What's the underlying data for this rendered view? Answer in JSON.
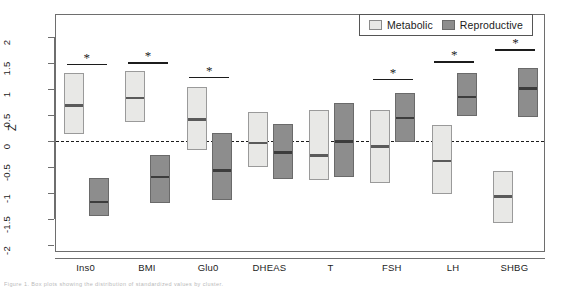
{
  "figure": {
    "caption": "Figure 1. Box plots showing the distribution of standardized values by cluster."
  },
  "legend": {
    "position": "top-right",
    "entries": [
      {
        "label": "Metabolic",
        "color": "#e8e8e6",
        "swatch": "metabolic-swatch"
      },
      {
        "label": "Reproductive",
        "color": "#8d8d8d",
        "swatch": "reproductive-swatch"
      }
    ]
  },
  "axes": {
    "ylabel": "Z",
    "xlabel": "",
    "ylim": [
      -2.28,
      2.28
    ],
    "yticks": [
      -2,
      -1.5,
      -1,
      -0.5,
      0,
      0.5,
      1,
      1.5,
      2
    ],
    "ytick_labels": [
      "-2",
      "-1.5",
      "-1",
      "-0.5",
      "0",
      "0.5",
      "1",
      "1.5",
      "2"
    ],
    "grid": false,
    "reference_line": 0
  },
  "chart_data": {
    "type": "bar",
    "title": "",
    "xlabel": "",
    "ylabel": "Z",
    "ylim": [
      -2.28,
      2.28
    ],
    "grid": false,
    "legend_position": "top-right",
    "reference_line": 0,
    "categories": [
      "Ins0",
      "BMI",
      "Glu0",
      "DHEAS",
      "T",
      "FSH",
      "LH",
      "SHBG"
    ],
    "series": [
      {
        "name": "Metabolic",
        "color": "#e8e8e6",
        "medians": [
          0.72,
          0.87,
          0.45,
          0.0,
          -0.24,
          -0.07,
          -0.35,
          -1.03
        ],
        "q1": [
          0.15,
          0.38,
          -0.15,
          -0.48,
          -0.73,
          -0.78,
          -1.0,
          -1.55
        ],
        "q3": [
          1.32,
          1.36,
          1.05,
          0.58,
          0.62,
          0.62,
          0.32,
          -0.55
        ]
      },
      {
        "name": "Reproductive",
        "color": "#8d8d8d",
        "medians": [
          -1.13,
          -0.65,
          -0.53,
          -0.18,
          0.03,
          0.48,
          0.88,
          1.05
        ],
        "q1": [
          -1.42,
          -1.18,
          -1.12,
          -0.72,
          -0.68,
          0.0,
          0.5,
          0.48
        ],
        "q3": [
          -0.7,
          -0.25,
          0.18,
          0.35,
          0.75,
          0.95,
          1.32,
          1.42
        ]
      }
    ],
    "significance": {
      "marker": "*",
      "categories": [
        "Ins0",
        "BMI",
        "Glu0",
        "FSH",
        "LH",
        "SHBG"
      ],
      "bar_levels": [
        1.5,
        1.53,
        1.25,
        1.22,
        1.55,
        1.78
      ]
    }
  }
}
